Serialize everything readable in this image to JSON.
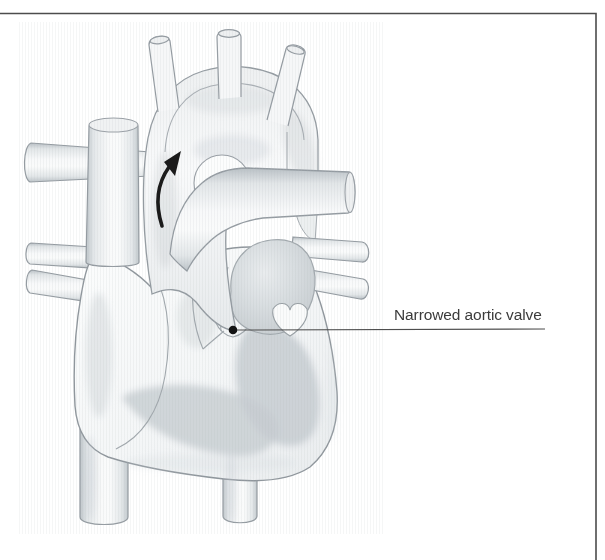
{
  "figure": {
    "label": "Narrowed aortic valve",
    "type": "medical-illustration"
  },
  "icons": {
    "blood_flow_arrow": "curved-up-arrow",
    "valve_marker": "filled-dot"
  },
  "style": {
    "background_color": "#ffffff",
    "frame_border_color": "#4c4c4c",
    "vessel_outline_color": "#949ba1",
    "chamber_shading_color": "#c7cdd1",
    "leader_line_color": "#4e4e4e",
    "marker_dot_color": "#141414",
    "flow_arrow_color": "#1b1b1b",
    "label_text_color": "#3b3b3b"
  }
}
